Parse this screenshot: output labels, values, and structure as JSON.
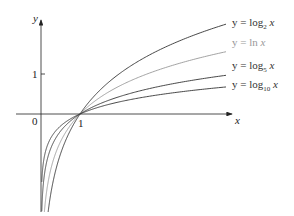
{
  "chart_data": {
    "type": "line",
    "title": "",
    "xlabel": "x",
    "ylabel": "y",
    "ticks": {
      "x": [
        {
          "value": 0,
          "label": "0"
        },
        {
          "value": 1,
          "label": "1"
        }
      ],
      "y": [
        {
          "value": 1,
          "label": "1"
        }
      ]
    },
    "series": [
      {
        "name": "y = log₂ x",
        "base": 2,
        "color": "#333333",
        "label_parts": [
          "y = log",
          "2",
          " x"
        ]
      },
      {
        "name": "y = ln x",
        "base": 2.71828,
        "color": "#999999",
        "label_parts": [
          "y = ln ",
          "",
          "x"
        ]
      },
      {
        "name": "y = log₅ x",
        "base": 5,
        "color": "#333333",
        "label_parts": [
          "y = log",
          "5",
          " x"
        ]
      },
      {
        "name": "y = log₁₀ x",
        "base": 10,
        "color": "#333333",
        "label_parts": [
          "y = log",
          "10",
          " x"
        ]
      }
    ],
    "common_point": {
      "x": 1,
      "y": 0
    },
    "grid": false
  },
  "axes": {
    "x_label": "x",
    "y_label": "y",
    "origin_label": "0",
    "x_tick_label": "1",
    "y_tick_label": "1"
  }
}
